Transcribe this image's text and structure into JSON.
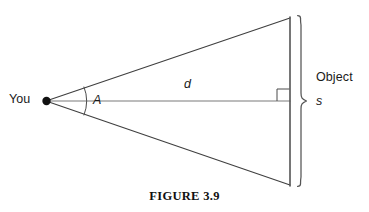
{
  "figure": {
    "caption": "FIGURE 3.9",
    "background_color": "#ffffff",
    "stroke_color": "#3c3c3c",
    "text_color": "#1a1a1a"
  },
  "labels": {
    "observer": "You",
    "angle": "A",
    "distance": "d",
    "object": "Object",
    "size": "s"
  },
  "diagram_data": {
    "type": "geometry-diagram",
    "description": "Angular size: a narrow isoceles triangle from an observer's eye to a distant object of physical size s at distance d, subtending angle A.",
    "vertex_point": {
      "label": "You",
      "x": 46,
      "y": 101
    },
    "triangle": {
      "apex": {
        "x": 46,
        "y": 101
      },
      "top_vertex": {
        "x": 290,
        "y": 18
      },
      "bottom_vertex": {
        "x": 290,
        "y": 185
      }
    },
    "baseline": {
      "name": "distance-line",
      "label": "d",
      "from_x": 46,
      "to_x": 290,
      "y": 101
    },
    "angle_arc": {
      "label": "A",
      "center_x": 46,
      "center_y": 101,
      "radius": 40
    },
    "right_angle_marker": {
      "x": 277,
      "y": 89,
      "size": 12
    },
    "object_bar": {
      "label": "Object",
      "x": 290,
      "top_y": 17,
      "bottom_y": 186
    },
    "size_brace": {
      "label": "s",
      "x": 300,
      "top_y": 17,
      "bottom_y": 186,
      "tip_y": 101
    }
  }
}
